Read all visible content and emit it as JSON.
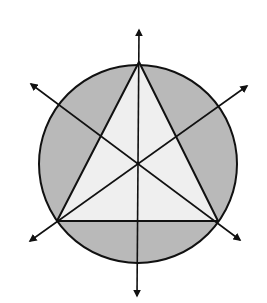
{
  "diagram": {
    "colors": {
      "background": "#ffffff",
      "circle_fill": "#b9b9b9",
      "triangle_fill": "#efefef",
      "stroke": "#111111"
    },
    "circle": {
      "cx": 138,
      "cy": 164,
      "r": 99
    },
    "triangle": {
      "vertices": [
        {
          "name": "top",
          "x": 139,
          "y": 62
        },
        {
          "name": "bottom-left",
          "x": 57,
          "y": 221
        },
        {
          "name": "bottom-right",
          "x": 218,
          "y": 221
        }
      ]
    },
    "centroid": {
      "x": 138,
      "y": 163
    },
    "arrows": [
      {
        "name": "vertical-median",
        "x1": 137,
        "y1": 296,
        "x2": 139,
        "y2": 30
      },
      {
        "name": "median-from-bottom-right",
        "x1": 240,
        "y1": 240,
        "x2": 31,
        "y2": 84
      },
      {
        "name": "median-from-bottom-left",
        "x1": 30,
        "y1": 241,
        "x2": 247,
        "y2": 86
      }
    ]
  }
}
